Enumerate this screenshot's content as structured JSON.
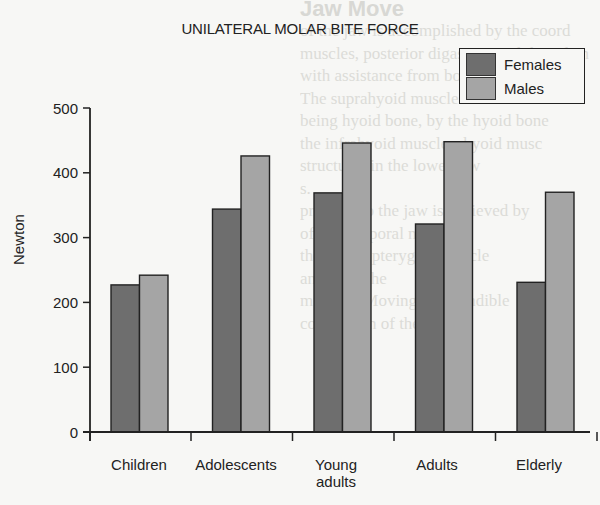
{
  "chart_data": {
    "type": "bar",
    "title": "UNILATERAL MOLAR BITE FORCE",
    "xlabel": "",
    "ylabel": "Newton",
    "ylim": [
      0,
      500
    ],
    "yticks": [
      0,
      100,
      200,
      300,
      400,
      500
    ],
    "grid": false,
    "legend_position": "top-right",
    "categories": [
      "Children",
      "Adolescents",
      "Young adults",
      "Adults",
      "Elderly"
    ],
    "series": [
      {
        "name": "Females",
        "color": "#6e6e6e",
        "values": [
          227,
          344,
          369,
          321,
          231
        ]
      },
      {
        "name": "Males",
        "color": "#a5a5a5",
        "values": [
          242,
          426,
          446,
          448,
          370
        ]
      }
    ]
  },
  "labels": {
    "title": "UNILATERAL MOLAR BITE FORCE",
    "ylabel": "Newton",
    "legend": [
      "Females",
      "Males"
    ],
    "yticks": [
      "0",
      "100",
      "200",
      "300",
      "400",
      "500"
    ],
    "categories": [
      "Children",
      "Adolescents",
      "Young",
      "Adults",
      "Elderly"
    ],
    "category_line2": [
      "",
      "",
      "adults",
      "",
      ""
    ]
  },
  "background_text": {
    "heading": "Jaw Move",
    "lines": [
      "of the jaw is accomplished by the coord",
      "muscles, posterior digastric, mylohyoid an",
      "with assistance from both lateral pter",
      "The suprahyoid muscles are load",
      "being hyoid bone, by the hyoid bone",
      "the infrahyoid muscles, hyoid musc",
      "structures in the lower jaw",
      "s.",
      "pressure to the jaw is achieved by",
      "of the temporal muscles",
      "the lateral pterygoid muscle",
      "and from the",
      "muscles. Moving the mandible",
      "contraction of the"
    ]
  }
}
